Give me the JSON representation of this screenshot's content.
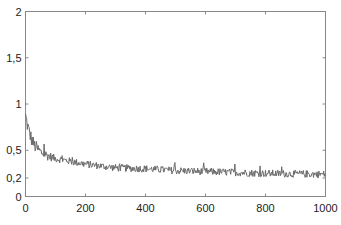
{
  "chart_data": {
    "type": "line",
    "title": "",
    "xlabel": "",
    "ylabel": "",
    "xlim": [
      0,
      1000
    ],
    "ylim": [
      0,
      2
    ],
    "grid": false,
    "legend": null,
    "x_ticks": [
      0,
      200,
      400,
      600,
      800,
      1000
    ],
    "x_tick_labels": [
      "0",
      "200",
      "400",
      "600",
      "800",
      "1000"
    ],
    "y_ticks": [
      0,
      0.2,
      0.5,
      1,
      1.5,
      2
    ],
    "y_tick_labels": [
      "0",
      "0,2",
      "0,5",
      "1",
      "1,5",
      "2"
    ],
    "series": [
      {
        "name": "noisy decay",
        "color": "#6a6a6a",
        "x": [
          0,
          10,
          20,
          30,
          50,
          75,
          100,
          150,
          200,
          250,
          300,
          400,
          500,
          600,
          700,
          800,
          900,
          1000
        ],
        "values": [
          0.87,
          0.72,
          0.62,
          0.55,
          0.48,
          0.44,
          0.41,
          0.38,
          0.35,
          0.33,
          0.31,
          0.3,
          0.28,
          0.27,
          0.26,
          0.25,
          0.245,
          0.24
        ],
        "noise_amplitude": 0.04
      }
    ]
  }
}
